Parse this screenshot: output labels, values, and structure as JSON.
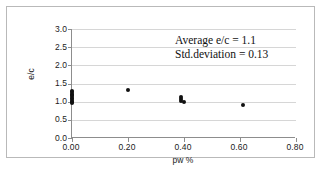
{
  "figure": {
    "background": "#ffffff",
    "frame_color": "#b9b9b9",
    "axis_color": "#8d8d8d",
    "grid_color": "#d6d6d6",
    "marker_color": "#111111"
  },
  "annotation": {
    "line1": "Average e/c = 1.1",
    "line2": "Std.deviation = 0.13"
  },
  "chart_data": {
    "type": "scatter",
    "title": "",
    "xlabel": "pw %",
    "ylabel": "e/c",
    "xlim": [
      0.0,
      0.8
    ],
    "ylim": [
      0.0,
      3.0
    ],
    "xticks": [
      0.0,
      0.2,
      0.4,
      0.6,
      0.8
    ],
    "xticklabels": [
      "0.00",
      "0.20",
      "0.40",
      "0.60",
      "0.80"
    ],
    "yticks": [
      0.0,
      0.5,
      1.0,
      1.5,
      2.0,
      2.5,
      3.0
    ],
    "yticklabels": [
      "0.0",
      "0.5",
      "1.0",
      "1.5",
      "2.0",
      "2.5",
      "3.0"
    ],
    "grid": "horizontal",
    "legend": "none",
    "marker": "filled-circle",
    "annotations": [
      "Average e/c = 1.1",
      "Std.deviation = 0.13"
    ],
    "series": [
      {
        "name": "e/c measurements",
        "points": [
          {
            "x": 0.0,
            "y": 1.3
          },
          {
            "x": 0.0,
            "y": 1.26
          },
          {
            "x": 0.0,
            "y": 1.22
          },
          {
            "x": 0.0,
            "y": 1.19
          },
          {
            "x": 0.0,
            "y": 1.15
          },
          {
            "x": 0.0,
            "y": 1.11
          },
          {
            "x": 0.0,
            "y": 1.07
          },
          {
            "x": 0.0,
            "y": 1.03
          },
          {
            "x": 0.0,
            "y": 0.99
          },
          {
            "x": 0.0,
            "y": 0.95
          },
          {
            "x": 0.2,
            "y": 1.33
          },
          {
            "x": 0.39,
            "y": 1.12
          },
          {
            "x": 0.39,
            "y": 1.07
          },
          {
            "x": 0.39,
            "y": 1.02
          },
          {
            "x": 0.4,
            "y": 0.98
          },
          {
            "x": 0.61,
            "y": 0.92
          }
        ]
      }
    ],
    "summary": {
      "average_ec": 1.1,
      "std_deviation": 0.13
    }
  }
}
